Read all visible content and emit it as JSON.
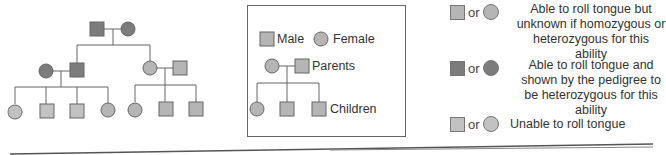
{
  "colors": {
    "unknown_fill": "#b5b5b5",
    "heterozygous_fill": "#7c7c7c",
    "unable_fill": "#c2c2c2",
    "line": "#666666"
  },
  "legend_box": {
    "male_label": "Male",
    "female_label": "Female",
    "parents_label": "Parents",
    "children_label": "Children"
  },
  "key": [
    {
      "id": "unknown",
      "or": "or",
      "text": "Able to roll tongue but unknown if homozygous or heterozygous for this ability"
    },
    {
      "id": "heterozygous",
      "or": "or",
      "text": "Able to roll tongue and shown by the pedigree to be heterozygous for this ability"
    },
    {
      "id": "unable",
      "or": "or",
      "text": "Unable to roll tongue"
    }
  ],
  "pedigree": {
    "generation_1": [
      {
        "sex": "male",
        "status": "heterozygous"
      },
      {
        "sex": "female",
        "status": "heterozygous"
      }
    ],
    "generation_2": [
      {
        "sex": "female",
        "status": "heterozygous",
        "family": "left"
      },
      {
        "sex": "male",
        "status": "heterozygous",
        "family": "left"
      },
      {
        "sex": "female",
        "status": "unknown",
        "family": "right"
      },
      {
        "sex": "male",
        "status": "unknown",
        "family": "right"
      }
    ],
    "generation_3": [
      {
        "sex": "female",
        "status": "unable"
      },
      {
        "sex": "male",
        "status": "unable"
      },
      {
        "sex": "male",
        "status": "unable"
      },
      {
        "sex": "female",
        "status": "unknown"
      },
      {
        "sex": "female",
        "status": "unknown"
      },
      {
        "sex": "male",
        "status": "unknown"
      },
      {
        "sex": "male",
        "status": "unknown"
      }
    ]
  }
}
